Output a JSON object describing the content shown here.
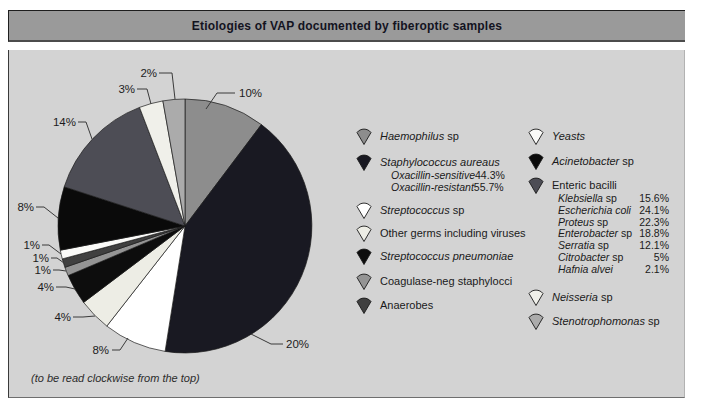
{
  "title": "Etiologies of VAP documented by fiberoptic samples",
  "footnote": "(to be read clockwise from the top)",
  "colors": {
    "page_bg": "#ffffff",
    "panel_bg": "#d3d3d3",
    "titlebar_bg": "#9a9a9a",
    "outline": "#1b1b1b"
  },
  "chart_data": {
    "type": "pie",
    "title": "Etiologies of VAP documented by fiberoptic samples",
    "reading_order": "clockwise from the top",
    "legend_position": "right, two columns",
    "slices": [
      {
        "label": "Haemophilus sp",
        "pct": "10%",
        "value": 10,
        "color": "#8d8d8d"
      },
      {
        "label": "Staphylococcus aureaus",
        "pct": "20%",
        "value": 20,
        "color": "#191922",
        "breakdown": [
          {
            "name": "Oxacillin-sensitive",
            "pct": "44.3%"
          },
          {
            "name": "Oxacillin-resistant",
            "pct": "55.7%"
          }
        ]
      },
      {
        "label": "Streptococcus sp",
        "pct": "8%",
        "value": 8,
        "color": "#ffffff"
      },
      {
        "label": "Other germs including viruses",
        "pct": "4%",
        "value": 4,
        "color": "#edede5"
      },
      {
        "label": "Streptococcus pneumoniae",
        "pct": "4%",
        "value": 4,
        "color": "#0d0d0d"
      },
      {
        "label": "Coagulase-neg staphylocci",
        "pct": "1%",
        "value": 1,
        "color": "#949494"
      },
      {
        "label": "Anaerobes",
        "pct": "1%",
        "value": 1,
        "color": "#404040"
      },
      {
        "label": "Yeasts",
        "pct": "1%",
        "value": 1,
        "color": "#fafaf8"
      },
      {
        "label": "Acinetobacter sp",
        "pct": "8%",
        "value": 8,
        "color": "#0a0a0a"
      },
      {
        "label": "Enteric bacilli",
        "pct": "14%",
        "value": 14,
        "color": "#4d4d55",
        "breakdown": [
          {
            "name": "Klebsiella sp",
            "pct": "15.6%"
          },
          {
            "name": "Escherichia coli",
            "pct": "24.1%"
          },
          {
            "name": "Proteus sp",
            "pct": "22.3%"
          },
          {
            "name": "Enterobacter sp",
            "pct": "18.8%"
          },
          {
            "name": "Serratia sp",
            "pct": "12.1%"
          },
          {
            "name": "Citrobacter sp",
            "pct": "5%"
          },
          {
            "name": "Hafnia alvei",
            "pct": "2.1%"
          }
        ]
      },
      {
        "label": "Neisseria sp",
        "pct": "3%",
        "value": 3,
        "color": "#f0f0ea"
      },
      {
        "label": "Stenotrophomonas sp",
        "pct": "2%",
        "value": 2,
        "color": "#ababab"
      }
    ]
  },
  "legend": {
    "left": [
      {
        "name": "haemophilus",
        "color": "#8d8d8d",
        "runs": [
          {
            "t": "Haemophilus",
            "em": 1
          },
          {
            "t": " sp"
          }
        ]
      },
      {
        "name": "staphylococcus-aureus",
        "color": "#191922",
        "runs": [
          {
            "t": "Staphylococcus aureaus",
            "em": 1
          }
        ],
        "sub": [
          {
            "runs": [
              {
                "t": "Oxacillin-sensitive",
                "em": 1
              }
            ],
            "value": "44.3%"
          },
          {
            "runs": [
              {
                "t": "Oxacillin-resistant",
                "em": 1
              }
            ],
            "value": "55.7%"
          }
        ]
      },
      {
        "name": "streptococcus",
        "color": "#ffffff",
        "runs": [
          {
            "t": "Streptococcus",
            "em": 1
          },
          {
            "t": " sp"
          }
        ]
      },
      {
        "name": "other-germs",
        "color": "#edede5",
        "runs": [
          {
            "t": "Other germs including viruses"
          }
        ]
      },
      {
        "name": "streptococcus-pneumoniae",
        "color": "#0d0d0d",
        "runs": [
          {
            "t": "Streptococcus pneumoniae",
            "em": 1
          }
        ]
      },
      {
        "name": "coagulase-neg-staphylocci",
        "color": "#949494",
        "runs": [
          {
            "t": "Coagulase-neg staphylocci"
          }
        ]
      },
      {
        "name": "anaerobes",
        "color": "#404040",
        "runs": [
          {
            "t": "Anaerobes"
          }
        ]
      }
    ],
    "right": [
      {
        "name": "yeasts",
        "color": "#fafaf8",
        "runs": [
          {
            "t": "Yeasts",
            "em": 1
          }
        ]
      },
      {
        "name": "acinetobacter",
        "color": "#0a0a0a",
        "runs": [
          {
            "t": "Acinetobacter",
            "em": 1
          },
          {
            "t": " sp"
          }
        ]
      },
      {
        "name": "enteric-bacilli",
        "color": "#4d4d55",
        "runs": [
          {
            "t": "Enteric bacilli"
          }
        ],
        "sub": [
          {
            "runs": [
              {
                "t": "Klebsiella",
                "em": 1
              },
              {
                "t": " sp"
              }
            ],
            "value": "15.6%"
          },
          {
            "runs": [
              {
                "t": "Escherichia coli",
                "em": 1
              }
            ],
            "value": "24.1%"
          },
          {
            "runs": [
              {
                "t": "Proteus",
                "em": 1
              },
              {
                "t": " sp"
              }
            ],
            "value": "22.3%"
          },
          {
            "runs": [
              {
                "t": "Enterobacter",
                "em": 1
              },
              {
                "t": " sp"
              }
            ],
            "value": "18.8%"
          },
          {
            "runs": [
              {
                "t": "Serratia",
                "em": 1
              },
              {
                "t": " sp"
              }
            ],
            "value": "12.1%"
          },
          {
            "runs": [
              {
                "t": "Citrobacter",
                "em": 1
              },
              {
                "t": " sp"
              }
            ],
            "value": "5%"
          },
          {
            "runs": [
              {
                "t": "Hafnia alvei",
                "em": 1
              }
            ],
            "value": "2.1%"
          }
        ]
      },
      {
        "name": "neisseria",
        "color": "#f0f0ea",
        "runs": [
          {
            "t": "Neisseria",
            "em": 1
          },
          {
            "t": " sp"
          }
        ]
      },
      {
        "name": "stenotrophomonas",
        "color": "#ababab",
        "runs": [
          {
            "t": "Stenotrophomonas",
            "em": 1
          },
          {
            "t": " sp"
          }
        ]
      }
    ]
  }
}
